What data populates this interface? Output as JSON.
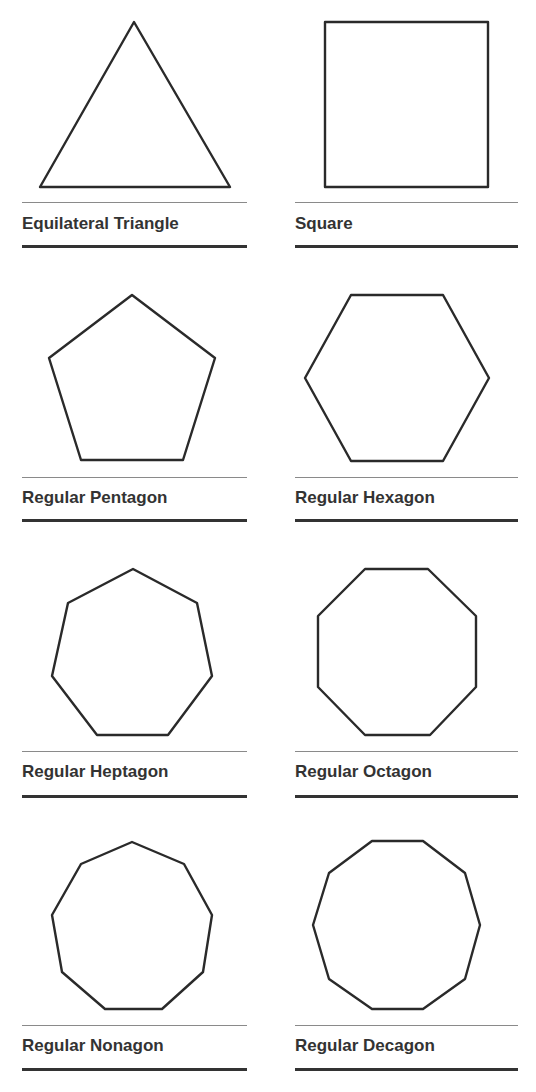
{
  "colors": {
    "stroke": "#2a2a2a",
    "text": "#333333",
    "rule_thin": "#8a8a8a",
    "rule_thick": "#333333"
  },
  "shapes": [
    {
      "name": "Equilateral Triangle",
      "sides": 3,
      "points": "134,22 230,187 40,187"
    },
    {
      "name": "Square",
      "sides": 4,
      "points": "325,22 488,22 488,187 325,187"
    },
    {
      "name": "Regular Pentagon",
      "sides": 5,
      "points": "132,295 215,358 183,460 81,460 49,358"
    },
    {
      "name": "Regular Hexagon",
      "sides": 6,
      "points": "351,295 443,295 489,378 443,461 351,461 305,378"
    },
    {
      "name": "Regular Heptagon",
      "sides": 7,
      "points": "133,569 197,603 212,676 168,735 97,735 52,676 68,603"
    },
    {
      "name": "Regular Octagon",
      "sides": 8,
      "points": "365,569 428,569 476,616 476,687 430,735 365,735 318,687 318,616"
    },
    {
      "name": "Regular Nonagon",
      "sides": 9,
      "points": "132,842 184,864 212,915 203,972 162,1009 105,1009 62,972 52,915 81,864"
    },
    {
      "name": "Regular Decagon",
      "sides": 10,
      "points": "372,841 423,841 465,873 480,925 465,979 423,1009 372,1009 329,979 313,925 329,873"
    }
  ]
}
